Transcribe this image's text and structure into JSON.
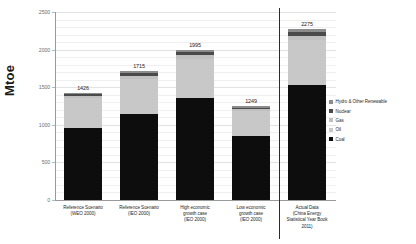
{
  "chart_data": {
    "type": "bar",
    "title": "",
    "xlabel": "",
    "ylabel": "Mtoe",
    "ylim": [
      0,
      2500
    ],
    "yticks": [
      0,
      500,
      1000,
      1500,
      2000,
      2500
    ],
    "grid": true,
    "stacked": true,
    "legend_position": "right",
    "categories": [
      "Reference Scenario (WEO 2000)",
      "Reference Scenario (IEO 2000)",
      "High economic growth case (IEO 2000)",
      "Low economic growth case (IEO 2000)",
      "Actual Data (China Energy Statistical Year Book 2011)"
    ],
    "category_lines": [
      [
        "Reference Scenario",
        "(WEO 2000)"
      ],
      [
        "Reference Scenario",
        "(IEO 2000)"
      ],
      [
        "High economic",
        "growth case",
        "(IEO 2000)"
      ],
      [
        "Low economic",
        "growth case",
        "(IEO 2000)"
      ],
      [
        "Actual Data",
        "(China Energy",
        "Statistical Year Book",
        "2011)"
      ]
    ],
    "series": [
      {
        "name": "Coal",
        "color": "#0d0d0d",
        "values": [
          960,
          1150,
          1360,
          855,
          1530
        ]
      },
      {
        "name": "Oil",
        "color": "#c8c8c8",
        "values": [
          400,
          460,
          520,
          325,
          600
        ]
      },
      {
        "name": "Gas",
        "color": "#c0c0c0",
        "values": [
          18,
          35,
          45,
          24,
          55
        ]
      },
      {
        "name": "Nuclear",
        "color": "#4a4a4a",
        "values": [
          28,
          40,
          40,
          25,
          50
        ]
      },
      {
        "name": "Hydro & Other Renewable",
        "color": "#8c8c8c",
        "values": [
          20,
          30,
          30,
          20,
          40
        ]
      }
    ],
    "totals": [
      1426,
      1715,
      1995,
      1249,
      2275
    ],
    "annotations": {
      "separator_after_category_index": 3
    }
  },
  "legend": {
    "items": [
      {
        "label": "Hydro & Other Renewable",
        "color": "#8c8c8c"
      },
      {
        "label": "Nuclear",
        "color": "#4a4a4a"
      },
      {
        "label": "Gas",
        "color": "#c0c0c0"
      },
      {
        "label": "Oil",
        "color": "#c8c8c8"
      },
      {
        "label": "Coal",
        "color": "#0d0d0d"
      }
    ]
  }
}
